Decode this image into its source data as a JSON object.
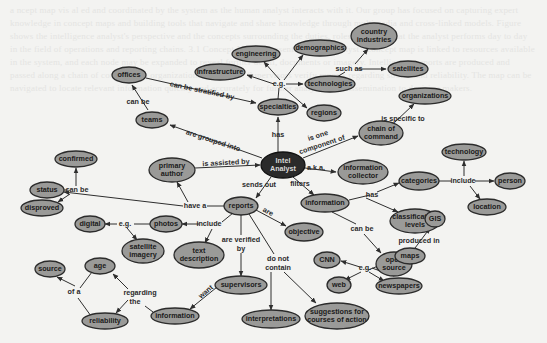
{
  "diagram": {
    "colors": {
      "background": "#f3f3f1",
      "node_fill": "#9a9a98",
      "center_fill": "#2a2a2a",
      "edge": "#2e2e2e"
    },
    "nodes": [
      {
        "id": "analyst",
        "lines": [
          "Intel",
          "Analyst"
        ],
        "x": 283,
        "y": 165,
        "rx": 22,
        "ry": 13,
        "dark": true
      },
      {
        "id": "offices",
        "lines": [
          "offices"
        ],
        "x": 129,
        "y": 75,
        "rx": 17,
        "ry": 8
      },
      {
        "id": "teams",
        "lines": [
          "teams"
        ],
        "x": 152,
        "y": 120,
        "rx": 16,
        "ry": 8
      },
      {
        "id": "specialties",
        "lines": [
          "specialties"
        ],
        "x": 278,
        "y": 107,
        "rx": 20,
        "ry": 8
      },
      {
        "id": "infrastructure",
        "lines": [
          "infrastructure"
        ],
        "x": 220,
        "y": 72,
        "rx": 25,
        "ry": 8
      },
      {
        "id": "engineering",
        "lines": [
          "engineering"
        ],
        "x": 256,
        "y": 54,
        "rx": 24,
        "ry": 8
      },
      {
        "id": "demographics",
        "lines": [
          "demographics"
        ],
        "x": 320,
        "y": 48,
        "rx": 26,
        "ry": 8
      },
      {
        "id": "technologies",
        "lines": [
          "technologies"
        ],
        "x": 330,
        "y": 84,
        "rx": 25,
        "ry": 8
      },
      {
        "id": "regions",
        "lines": [
          "regions"
        ],
        "x": 324,
        "y": 113,
        "rx": 17,
        "ry": 8
      },
      {
        "id": "country-industries",
        "lines": [
          "country",
          "industries"
        ],
        "x": 374,
        "y": 36,
        "rx": 23,
        "ry": 13
      },
      {
        "id": "satellites",
        "lines": [
          "satellites"
        ],
        "x": 408,
        "y": 69,
        "rx": 20,
        "ry": 8
      },
      {
        "id": "organizations",
        "lines": [
          "organizations"
        ],
        "x": 425,
        "y": 96,
        "rx": 26,
        "ry": 8
      },
      {
        "id": "chain-of-command",
        "lines": [
          "chain of",
          "command"
        ],
        "x": 381,
        "y": 133,
        "rx": 22,
        "ry": 12
      },
      {
        "id": "information-collector",
        "lines": [
          "information",
          "collector"
        ],
        "x": 363,
        "y": 172,
        "rx": 25,
        "ry": 12
      },
      {
        "id": "primary-author",
        "lines": [
          "primary",
          "author"
        ],
        "x": 172,
        "y": 170,
        "rx": 23,
        "ry": 12
      },
      {
        "id": "status",
        "lines": [
          "status"
        ],
        "x": 47,
        "y": 190,
        "rx": 17,
        "ry": 8
      },
      {
        "id": "confirmed",
        "lines": [
          "confirmed"
        ],
        "x": 76,
        "y": 159,
        "rx": 21,
        "ry": 8
      },
      {
        "id": "disproved",
        "lines": [
          "disproved"
        ],
        "x": 42,
        "y": 208,
        "rx": 21,
        "ry": 8
      },
      {
        "id": "reports",
        "lines": [
          "reports"
        ],
        "x": 241,
        "y": 206,
        "rx": 17,
        "ry": 9
      },
      {
        "id": "photos",
        "lines": [
          "photos"
        ],
        "x": 166,
        "y": 224,
        "rx": 16,
        "ry": 8
      },
      {
        "id": "digital",
        "lines": [
          "digital"
        ],
        "x": 90,
        "y": 224,
        "rx": 15,
        "ry": 8
      },
      {
        "id": "satellite-imagery",
        "lines": [
          "satellite",
          "imagery"
        ],
        "x": 143,
        "y": 251,
        "rx": 21,
        "ry": 12
      },
      {
        "id": "text-description",
        "lines": [
          "text",
          "description"
        ],
        "x": 199,
        "y": 255,
        "rx": 25,
        "ry": 13
      },
      {
        "id": "objective",
        "lines": [
          "objective"
        ],
        "x": 304,
        "y": 232,
        "rx": 19,
        "ry": 9
      },
      {
        "id": "supervisors",
        "lines": [
          "supervisors"
        ],
        "x": 241,
        "y": 285,
        "rx": 26,
        "ry": 9
      },
      {
        "id": "information-lower",
        "lines": [
          "information"
        ],
        "x": 175,
        "y": 316,
        "rx": 24,
        "ry": 8
      },
      {
        "id": "age",
        "lines": [
          "age"
        ],
        "x": 100,
        "y": 266,
        "rx": 15,
        "ry": 8
      },
      {
        "id": "source",
        "lines": [
          "source"
        ],
        "x": 50,
        "y": 269,
        "rx": 15,
        "ry": 8
      },
      {
        "id": "reliability",
        "lines": [
          "reliability"
        ],
        "x": 105,
        "y": 321,
        "rx": 23,
        "ry": 8
      },
      {
        "id": "interpretations",
        "lines": [
          "interpretations"
        ],
        "x": 271,
        "y": 319,
        "rx": 29,
        "ry": 9
      },
      {
        "id": "suggestions",
        "lines": [
          "suggestions for",
          "courses of action"
        ],
        "x": 337,
        "y": 316,
        "rx": 32,
        "ry": 13
      },
      {
        "id": "information",
        "lines": [
          "information"
        ],
        "x": 325,
        "y": 203,
        "rx": 24,
        "ry": 9
      },
      {
        "id": "categories",
        "lines": [
          "categories"
        ],
        "x": 419,
        "y": 181,
        "rx": 20,
        "ry": 9
      },
      {
        "id": "technology",
        "lines": [
          "technology"
        ],
        "x": 464,
        "y": 152,
        "rx": 22,
        "ry": 8
      },
      {
        "id": "person",
        "lines": [
          "person"
        ],
        "x": 510,
        "y": 181,
        "rx": 15,
        "ry": 8
      },
      {
        "id": "location",
        "lines": [
          "location"
        ],
        "x": 487,
        "y": 207,
        "rx": 19,
        "ry": 8
      },
      {
        "id": "classification-levels",
        "lines": [
          "classification",
          "levels"
        ],
        "x": 415,
        "y": 221,
        "rx": 25,
        "ry": 12
      },
      {
        "id": "gis",
        "lines": [
          "GIS"
        ],
        "x": 435,
        "y": 219,
        "rx": 10,
        "ry": 8
      },
      {
        "id": "open-source",
        "lines": [
          "open",
          "source"
        ],
        "x": 394,
        "y": 264,
        "rx": 18,
        "ry": 12
      },
      {
        "id": "maps",
        "lines": [
          "maps"
        ],
        "x": 410,
        "y": 256,
        "rx": 15,
        "ry": 8
      },
      {
        "id": "cnn",
        "lines": [
          "CNN"
        ],
        "x": 327,
        "y": 260,
        "rx": 13,
        "ry": 8
      },
      {
        "id": "web",
        "lines": [
          "web"
        ],
        "x": 339,
        "y": 285,
        "rx": 12,
        "ry": 8
      },
      {
        "id": "newspapers",
        "lines": [
          "newspapers"
        ],
        "x": 399,
        "y": 286,
        "rx": 23,
        "ry": 8
      }
    ],
    "link_labels": [
      {
        "id": "can-be-stratified-by",
        "text": "can be stratified by",
        "x": 202,
        "y": 91,
        "rot": 12
      },
      {
        "id": "can-be-teams",
        "text": "can be",
        "x": 138,
        "y": 102,
        "rot": 0
      },
      {
        "id": "eg-specialties",
        "text": "e.g.",
        "x": 279,
        "y": 84,
        "rot": 0
      },
      {
        "id": "such-as",
        "text": "such as",
        "x": 349,
        "y": 69,
        "rot": 0
      },
      {
        "id": "is-specific-to",
        "text": "is specific to",
        "x": 403,
        "y": 119,
        "rot": 0
      },
      {
        "id": "has-specialties",
        "text": "has",
        "x": 278,
        "y": 135,
        "rot": 0
      },
      {
        "id": "are-grouped-into",
        "text": "are grouped into",
        "x": 213,
        "y": 141,
        "rot": 18
      },
      {
        "id": "is-one-component-of",
        "text": "is one",
        "x": 318,
        "y": 136,
        "rot": -18
      },
      {
        "id": "is-one-component-of-2",
        "text": "component of",
        "x": 322,
        "y": 145,
        "rot": -18
      },
      {
        "id": "aka",
        "text": "a.k.a.",
        "x": 316,
        "y": 168,
        "rot": 0
      },
      {
        "id": "is-assisted-by",
        "text": "is assisted by",
        "x": 226,
        "y": 163,
        "rot": -3
      },
      {
        "id": "can-be-status",
        "text": "can be",
        "x": 77,
        "y": 190,
        "rot": 0
      },
      {
        "id": "have-a",
        "text": "have a",
        "x": 195,
        "y": 206,
        "rot": 0
      },
      {
        "id": "sends-out",
        "text": "sends out",
        "x": 259,
        "y": 185,
        "rot": 0
      },
      {
        "id": "filters",
        "text": "filters",
        "x": 300,
        "y": 184,
        "rot": 0
      },
      {
        "id": "include-reports",
        "text": "include",
        "x": 209,
        "y": 224,
        "rot": 0
      },
      {
        "id": "eg-photos",
        "text": "e.g.",
        "x": 125,
        "y": 224,
        "rot": 0
      },
      {
        "id": "are",
        "text": "are",
        "x": 268,
        "y": 212,
        "rot": 30
      },
      {
        "id": "are-verified-by",
        "text": "are verified",
        "x": 241,
        "y": 240,
        "rot": 0
      },
      {
        "id": "are-verified-by-2",
        "text": "by",
        "x": 241,
        "y": 249,
        "rot": 0
      },
      {
        "id": "do-not-contain",
        "text": "do not",
        "x": 278,
        "y": 259,
        "rot": 0
      },
      {
        "id": "do-not-contain-2",
        "text": "contain",
        "x": 278,
        "y": 268,
        "rot": 0
      },
      {
        "id": "want",
        "text": "want",
        "x": 206,
        "y": 292,
        "rot": -40
      },
      {
        "id": "regarding-the",
        "text": "regarding",
        "x": 140,
        "y": 293,
        "rot": 0
      },
      {
        "id": "regarding-the-2",
        "text": "the",
        "x": 135,
        "y": 302,
        "rot": 0
      },
      {
        "id": "of-a",
        "text": "of a",
        "x": 74,
        "y": 292,
        "rot": 0
      },
      {
        "id": "has-information",
        "text": "has",
        "x": 372,
        "y": 195,
        "rot": 0
      },
      {
        "id": "include-categories",
        "text": "include",
        "x": 463,
        "y": 181,
        "rot": 0
      },
      {
        "id": "can-be-open-source",
        "text": "can be",
        "x": 362,
        "y": 229,
        "rot": 0
      },
      {
        "id": "produced-in",
        "text": "produced in",
        "x": 419,
        "y": 241,
        "rot": 0
      },
      {
        "id": "eg-open-source",
        "text": "e.g.",
        "x": 365,
        "y": 268,
        "rot": 0
      }
    ],
    "edges": [
      {
        "d": "M146,78 L256,103",
        "arrow": true
      },
      {
        "d": "M148,110 L132,85",
        "arrow": true
      },
      {
        "d": "M278,152 L278,117",
        "arrow": true
      },
      {
        "d": "M262,158 L170,125",
        "arrow": true
      },
      {
        "d": "M278,99 L279,88",
        "arrow": false
      },
      {
        "d": "M274,84 L247,75",
        "arrow": true
      },
      {
        "d": "M280,80 L264,62",
        "arrow": true
      },
      {
        "d": "M284,80 L303,55",
        "arrow": true
      },
      {
        "d": "M286,84 L303,84",
        "arrow": true
      },
      {
        "d": "M284,88 L307,108",
        "arrow": true
      },
      {
        "d": "M357,69 L386,69",
        "arrow": true
      },
      {
        "d": "M355,64 L368,49",
        "arrow": true
      },
      {
        "d": "M337,77 L345,72",
        "arrow": false
      },
      {
        "d": "M395,122 L414,104",
        "arrow": true
      },
      {
        "d": "M303,158 L358,136",
        "arrow": true
      },
      {
        "d": "M305,168 L336,172",
        "arrow": true
      },
      {
        "d": "M195,168 L260,165",
        "arrow": true
      },
      {
        "d": "M271,177 L256,198",
        "arrow": true
      },
      {
        "d": "M293,177 L314,195",
        "arrow": true
      },
      {
        "d": "M225,206 L207,206",
        "arrow": false
      },
      {
        "d": "M183,206 L64,192",
        "arrow": true
      },
      {
        "d": "M188,202 L177,182",
        "arrow": true
      },
      {
        "d": "M68,190 L58,190",
        "arrow": false
      },
      {
        "d": "M76,186 L76,168",
        "arrow": true
      },
      {
        "d": "M70,194 L58,202",
        "arrow": true
      },
      {
        "d": "M233,213 L222,222",
        "arrow": false
      },
      {
        "d": "M199,224 L182,224",
        "arrow": true
      },
      {
        "d": "M150,224 L134,224",
        "arrow": false
      },
      {
        "d": "M117,224 L105,224",
        "arrow": true
      },
      {
        "d": "M127,228 L137,240",
        "arrow": true
      },
      {
        "d": "M212,229 L205,243",
        "arrow": true
      },
      {
        "d": "M256,210 L286,226",
        "arrow": true
      },
      {
        "d": "M241,215 L241,235",
        "arrow": false
      },
      {
        "d": "M241,253 L241,276",
        "arrow": true
      },
      {
        "d": "M249,214 L274,254",
        "arrow": false
      },
      {
        "d": "M271,272 L271,310",
        "arrow": true
      },
      {
        "d": "M284,272 L316,303",
        "arrow": true
      },
      {
        "d": "M222,283 L190,309",
        "arrow": true
      },
      {
        "d": "M153,312 L145,306",
        "arrow": false
      },
      {
        "d": "M128,289 L113,274",
        "arrow": true
      },
      {
        "d": "M128,300 L116,313",
        "arrow": true
      },
      {
        "d": "M75,286 L57,277",
        "arrow": true
      },
      {
        "d": "M91,316 L78,298",
        "arrow": false
      },
      {
        "d": "M92,272 L80,288",
        "arrow": false
      },
      {
        "d": "M349,200 L370,195",
        "arrow": false
      },
      {
        "d": "M377,192 L399,183",
        "arrow": true
      },
      {
        "d": "M366,198 L398,212",
        "arrow": true
      },
      {
        "d": "M439,181 L451,181",
        "arrow": false
      },
      {
        "d": "M475,181 L494,181",
        "arrow": true
      },
      {
        "d": "M464,176 L464,161",
        "arrow": true
      },
      {
        "d": "M470,186 L480,199",
        "arrow": true
      },
      {
        "d": "M332,212 L356,224",
        "arrow": false
      },
      {
        "d": "M364,234 L381,253",
        "arrow": true
      },
      {
        "d": "M415,248 L430,228",
        "arrow": true
      },
      {
        "d": "M394,276 L372,268",
        "arrow": false
      },
      {
        "d": "M360,267 L341,261",
        "arrow": true
      },
      {
        "d": "M368,270 L396,259",
        "arrow": true
      },
      {
        "d": "M361,272 L345,280",
        "arrow": true
      },
      {
        "d": "M369,272 L384,281",
        "arrow": true
      }
    ]
  },
  "background_text": "a ncept map vis al ed and coordinated by the system as the human analyst interacts with it. Our group has focused on capturing expert knowledge in concept maps and building tools that navigate and share knowledge through multimedia and cross-linked models. Figure shows the intelligence analyst's perspective and the concepts surrounding the duties, roles and tasks that the analyst performs day to day in the field of operations and reporting chains. 3.1 Concept Map Representation The analyst's concept map is linked to resources available in the system, and each node may be expanded to reveal further detail, documents or imagery. Intelligence reports are produced and passed along a chain of command to organizations for review. Supervisors verify reports regarding source and reliability. The map can be navigated to locate relevant information quickly and accurately for further analysis and dissemination to decision makers."
}
